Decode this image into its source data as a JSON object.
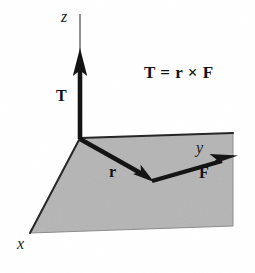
{
  "figure": {
    "equation": "T = r × F",
    "axes": {
      "z_label": "z",
      "x_label": "x",
      "y_label": "y"
    },
    "vectors": {
      "torque_label": "T",
      "position_label": "r",
      "force_label": "F"
    },
    "colors": {
      "background": "#ffffff",
      "plane_fill": "#b5b5b5",
      "plane_edge": "#3a3a3a",
      "vector": "#141414",
      "text": "#111111"
    },
    "geometry": {
      "origin": [
        80,
        138
      ],
      "plane_corners": [
        [
          80,
          138
        ],
        [
          233,
          133
        ],
        [
          233,
          226
        ],
        [
          30,
          233
        ]
      ],
      "z_axis_tip": [
        80,
        14
      ],
      "torque_arrow_tip": [
        80,
        50
      ],
      "position_arrow_tip": [
        152,
        181
      ],
      "force_arrow_tip": [
        237,
        156
      ]
    }
  }
}
